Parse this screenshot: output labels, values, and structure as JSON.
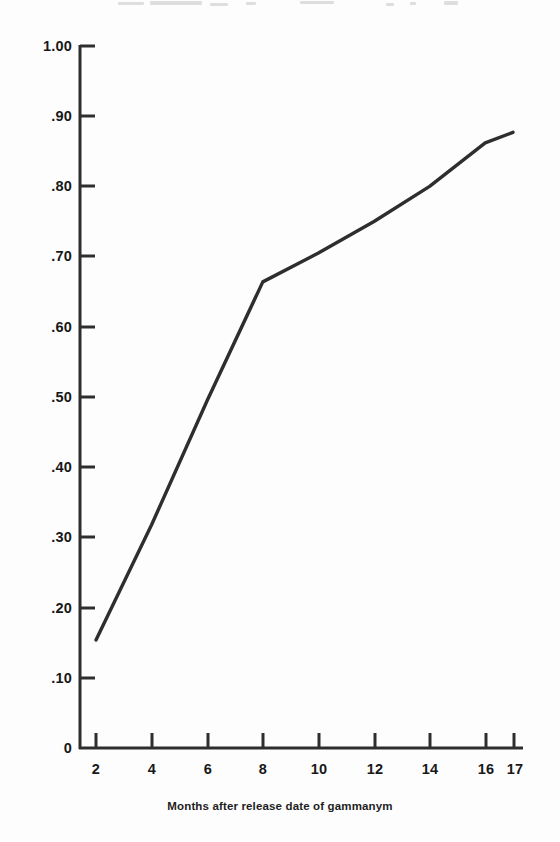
{
  "figure": {
    "background_color": "#fdfdfd",
    "ink_color": "#2e2e2e",
    "text_color": "#181818"
  },
  "chart_data": {
    "type": "line",
    "title": "",
    "subtitle": "",
    "xlabel": "Months after release date of gammanym",
    "ylabel": "",
    "x": [
      2,
      4,
      6,
      8,
      10,
      12,
      14,
      16,
      17
    ],
    "values": [
      0.154,
      0.318,
      0.495,
      0.664,
      0.705,
      0.75,
      0.8,
      0.862,
      0.877
    ],
    "series": [
      {
        "name": "",
        "values": [
          0.154,
          0.318,
          0.495,
          0.664,
          0.705,
          0.75,
          0.8,
          0.862,
          0.877
        ]
      }
    ],
    "xlim": [
      0,
      17
    ],
    "ylim": [
      0,
      1.0
    ],
    "xticks": [
      2,
      4,
      6,
      8,
      10,
      12,
      14,
      16,
      17
    ],
    "xtick_labels": [
      "2",
      "4",
      "6",
      "8",
      "10",
      "12",
      "14",
      "16",
      "17"
    ],
    "yticks": [
      0,
      0.1,
      0.2,
      0.3,
      0.4,
      0.5,
      0.6,
      0.7,
      0.8,
      0.9,
      1.0
    ],
    "ytick_labels": [
      "0",
      ".10",
      ".20",
      ".30",
      ".40",
      ".50",
      ".60",
      ".70",
      ".80",
      ".90",
      "1.00"
    ],
    "grid": false,
    "legend": null,
    "legend_position": "none",
    "annotations": [],
    "line_color": "#2e2e2e",
    "line_width": 3,
    "markers": false
  },
  "axes": {
    "y_axis_name": "vertical-axis",
    "x_axis_name": "horizontal-axis",
    "origin_label": "0"
  },
  "caption": {
    "text": "Months after release date of gammanym"
  }
}
